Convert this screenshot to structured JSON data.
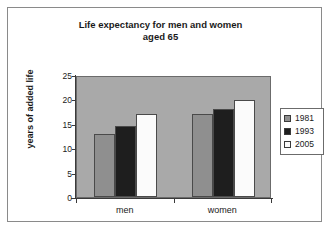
{
  "chart_data": {
    "type": "bar",
    "title": "Life expectancy for men and women aged 65",
    "title_line1": "Life expectancy for men and women",
    "title_line2": "aged 65",
    "xlabel": "",
    "ylabel": "years of added life",
    "categories": [
      "men",
      "women"
    ],
    "series": [
      {
        "name": "1981",
        "values": [
          13,
          17
        ],
        "color": "#8f8f8f"
      },
      {
        "name": "1993",
        "values": [
          14.5,
          18
        ],
        "color": "#1e1e1e"
      },
      {
        "name": "2005",
        "values": [
          17,
          19.8
        ],
        "color": "#fbfbfb"
      }
    ],
    "ylim": [
      0,
      25
    ],
    "yticks": [
      0,
      5,
      10,
      15,
      20,
      25
    ],
    "ytick_labels": [
      "0",
      "5",
      "10",
      "15",
      "20",
      "25"
    ],
    "grid": false,
    "legend_position": "right",
    "plot_background": "#a9a9a9",
    "figure_background": "#ffffff"
  }
}
